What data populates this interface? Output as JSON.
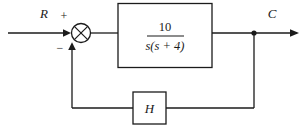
{
  "diagram": {
    "type": "control-system-block-diagram",
    "title": "",
    "background_color": "#ffffff",
    "line_color": "#1b1b1b",
    "signals": {
      "input_label": "R",
      "output_label": "C"
    },
    "summing_junction": {
      "name": "summing-junction",
      "glyph": "circle-with-cross",
      "positive_sign": "+",
      "negative_sign": "−"
    },
    "forward_block": {
      "name": "forward-path-block",
      "numerator": "10",
      "denominator": "s(s + 4)"
    },
    "feedback_block": {
      "name": "feedback-block",
      "label": "H"
    },
    "nodes": {
      "takeoff_point": "output-takeoff-node"
    }
  }
}
